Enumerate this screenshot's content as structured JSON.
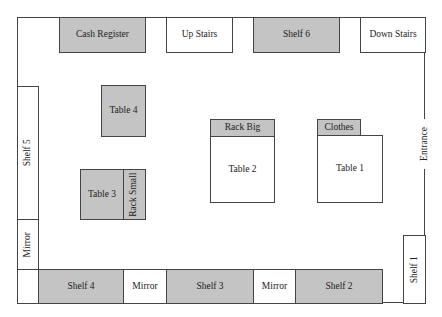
{
  "floor_plan": {
    "colors": {
      "filled": "#c4c4c4",
      "empty": "#ffffff",
      "line": "#444444"
    },
    "top_row": [
      {
        "label": "Cash Register",
        "fill": "gray"
      },
      {
        "label": "Up Stairs",
        "fill": "white"
      },
      {
        "label": "Shelf 6",
        "fill": "gray"
      },
      {
        "label": "Down Stairs",
        "fill": "white"
      }
    ],
    "left_wall": [
      {
        "label": "Shelf 5",
        "fill": "white"
      },
      {
        "label": "Mirror",
        "fill": "white"
      }
    ],
    "center": {
      "table4": "Table 4",
      "table3": "Table 3",
      "rack_small": "Rack Small",
      "rack_big": "Rack Big",
      "table2": "Table 2",
      "clothes": "Clothes",
      "table1": "Table 1"
    },
    "right_wall": {
      "entrance": "Entrance",
      "shelf1": "Shelf 1"
    },
    "bottom_row": [
      {
        "label": "Shelf 4",
        "fill": "gray"
      },
      {
        "label": "Mirror",
        "fill": "white"
      },
      {
        "label": "Shelf 3",
        "fill": "gray"
      },
      {
        "label": "Mirror",
        "fill": "white"
      },
      {
        "label": "Shelf 2",
        "fill": "gray"
      }
    ]
  }
}
